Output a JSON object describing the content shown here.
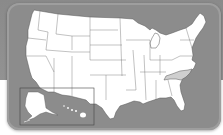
{
  "map": {
    "title": "United States",
    "highlighted_state": "North Carolina",
    "inset_states": [
      "Alaska",
      "Hawaii"
    ],
    "colors": {
      "background_top": "#8a8a8a",
      "panel": "#8c8c8c",
      "state_fill": "#ffffff",
      "state_border": "#555555",
      "highlight_fill": "#cfcfcf",
      "inset_border": "#444444",
      "bottom_background": "#ffffff"
    }
  }
}
